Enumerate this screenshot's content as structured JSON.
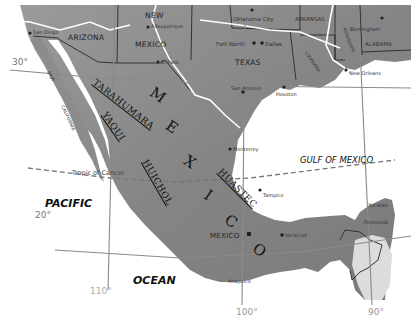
{
  "map": {
    "oceans": {
      "pacific_1": "PACIFIC",
      "pacific_2": "OCEAN",
      "gulf": "GULF OF MEXICO"
    },
    "country_letters": [
      "M",
      "E",
      "X",
      "I",
      "C",
      "O"
    ],
    "states": {
      "arizona": "ARIZONA",
      "new": "NEW",
      "mexico": "MEXICO",
      "texas": "TEXAS",
      "arkansas": "ARKANSAS",
      "louisiana": "LOUISIANA",
      "mississippi": "MISSISSIPPI",
      "alabama": "ALABAMA",
      "baja": "BAJA",
      "california": "CALIFORNIA"
    },
    "cities": {
      "san_diego": "San Diego",
      "albuquerque": "Albuquerque",
      "el_paso": "El Paso",
      "oklahoma_city": "Oklahoma City",
      "fort_worth": "Fort Worth",
      "dallas": "Dallas",
      "san_antonio": "San Antonio",
      "houston": "Houston",
      "birmingham": "Birmingham",
      "new_orleans": "New Orleans",
      "monterrey": "Monterrey",
      "tampico": "Tampico",
      "mexico_city": "MEXICO",
      "veracruz": "Veracruz",
      "acapulco": "Acapulco",
      "yucatan_1": "Yucatan",
      "yucatan_2": "Peninsula"
    },
    "tribes": {
      "tarahumara": "TARAHUMARA",
      "yaqui": "YAQUI",
      "huichol": "HUICHOL",
      "huastec": "HUASTEC"
    },
    "grid": {
      "lat_30": "30°",
      "lat_20": "20°",
      "lon_110": "110°",
      "lon_100": "100°",
      "lon_90": "90°",
      "tropic": "Tropic of Cancer"
    },
    "colors": {
      "land": "#8f8f8f",
      "land_dark": "#6e6e6e",
      "water": "#ffffff",
      "border": "#333333",
      "river": "#ffffff",
      "grid": "#8a8a8a"
    }
  }
}
